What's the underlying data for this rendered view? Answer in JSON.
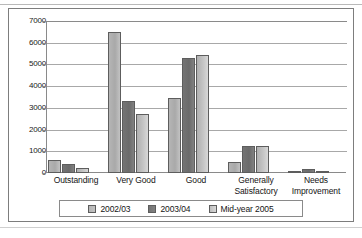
{
  "chart_data": {
    "type": "bar",
    "title": "",
    "xlabel": "",
    "ylabel": "",
    "ylim": [
      0,
      7000
    ],
    "ytick_step": 1000,
    "yticks": [
      "7000",
      "6000",
      "5000",
      "4000",
      "3000",
      "2000",
      "1000",
      "0"
    ],
    "grid": true,
    "legend_position": "bottom",
    "categories": [
      "Outstanding",
      "Very Good",
      "Good",
      "Generally\nSatisfactory",
      "Needs\nImprovement"
    ],
    "category_lines": [
      [
        "Outstanding"
      ],
      [
        "Very Good"
      ],
      [
        "Good"
      ],
      [
        "Generally",
        "Satisfactory"
      ],
      [
        "Needs",
        "Improvement"
      ]
    ],
    "series": [
      {
        "name": "2002/03",
        "color": "#b5b5b5",
        "values": [
          600,
          6500,
          3450,
          500,
          50
        ]
      },
      {
        "name": "2003/04",
        "color": "#747474",
        "values": [
          400,
          3300,
          5300,
          1250,
          200
        ]
      },
      {
        "name": "Mid-year 2005",
        "color": "#c6c6c6",
        "values": [
          220,
          2700,
          5450,
          1230,
          90
        ]
      }
    ]
  },
  "legend": {
    "items": [
      {
        "label": "2002/03"
      },
      {
        "label": "2003/04"
      },
      {
        "label": "Mid-year 2005"
      }
    ]
  },
  "colors": {
    "series_1": "#b5b5b5",
    "series_2": "#747474",
    "series_3": "#c6c6c6",
    "gridline": "#a8a8a8",
    "axis": "#8a8a8a",
    "frame": "#7d7d7d",
    "text": "#141414",
    "background": "#ffffff"
  }
}
